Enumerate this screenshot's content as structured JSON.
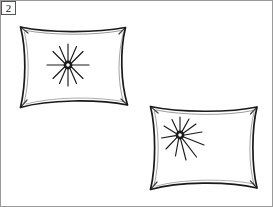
{
  "figure": {
    "panel_label": "2",
    "title": "",
    "caption": "",
    "background_color": "#ffffff",
    "ink_color": "#1a1a1a",
    "frame_color": "#8a8a8a",
    "width": 273,
    "height": 207,
    "style": "line-drawing",
    "objects": [
      {
        "name": "pillow-upper-left",
        "label": "",
        "corners": [
          [
            20,
            27
          ],
          [
            125,
            27
          ],
          [
            128,
            105
          ],
          [
            20,
            108
          ]
        ],
        "tuft": {
          "center": [
            68,
            65
          ],
          "ray_count": 12,
          "inner_radius": 4,
          "outer_radius": 21,
          "hollow_center": true
        }
      },
      {
        "name": "pillow-lower-right",
        "label": "",
        "corners": [
          [
            150,
            106
          ],
          [
            257,
            107
          ],
          [
            257,
            188
          ],
          [
            150,
            190
          ]
        ],
        "tuft": {
          "center": [
            180,
            135
          ],
          "ray_count": 12,
          "inner_radius": 4,
          "outer_radius": 24,
          "hollow_center": true
        }
      }
    ]
  }
}
